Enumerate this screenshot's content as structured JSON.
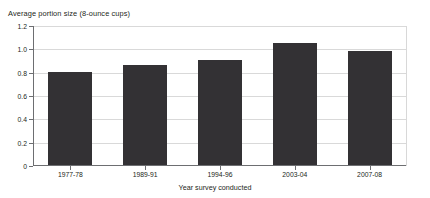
{
  "chart_data": {
    "type": "bar",
    "title": "Average portion size (8-ounce cups)",
    "xlabel": "Year survey conducted",
    "ylabel": "",
    "categories": [
      "1977-78",
      "1989-91",
      "1994-96",
      "2003-04",
      "2007-08"
    ],
    "values": [
      0.8,
      0.86,
      0.9,
      1.05,
      0.98
    ],
    "ylim": [
      0,
      1.2
    ],
    "ytick_labels": [
      "0",
      "0.2",
      "0.4",
      "0.6",
      "0.8",
      "1.0",
      "1.2"
    ],
    "ytick_values": [
      0,
      0.2,
      0.4,
      0.6,
      0.8,
      1.0,
      1.2
    ],
    "grid": true,
    "legend": false,
    "bar_color": "#333134",
    "gridline_color": "#d9d9d9",
    "axis_color": "#6d6e71",
    "background_color": "#ffffff"
  }
}
